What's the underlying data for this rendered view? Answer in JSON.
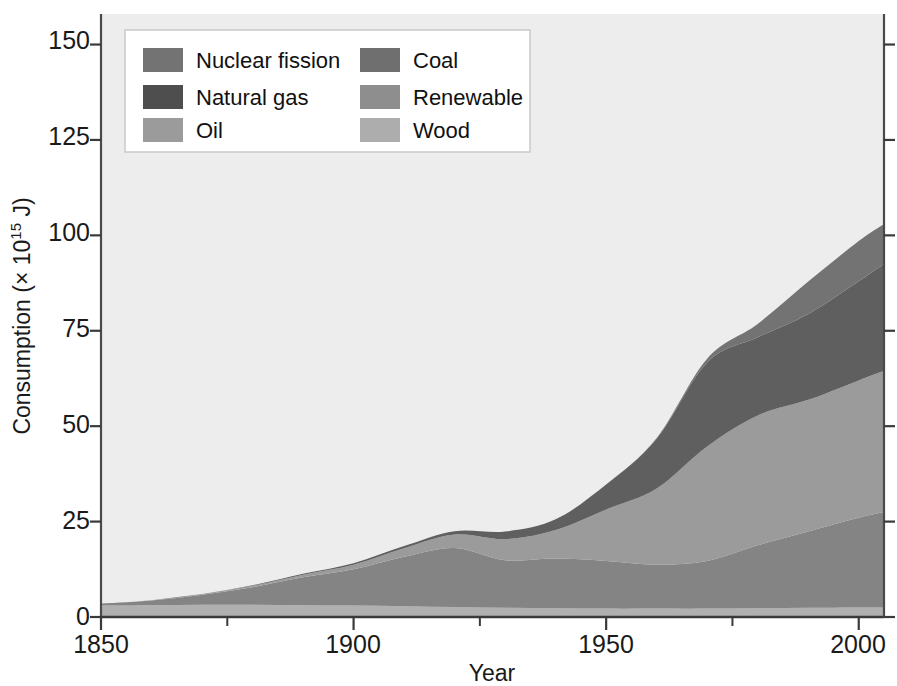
{
  "chart_data": {
    "type": "area",
    "stacked": true,
    "title": "",
    "xlabel": "Year",
    "ylabel": "Consumption (× 10¹⁵ J)",
    "ylabel_parts": {
      "prefix": "Consumption (× 10",
      "exponent": "15",
      "suffix": " J)"
    },
    "xlim": [
      1850,
      2005
    ],
    "ylim": [
      0,
      158
    ],
    "xticks": [
      1850,
      1900,
      1950,
      2000
    ],
    "xtick_labels": [
      "1850",
      "1900",
      "1950",
      "2000"
    ],
    "xminorticks": [
      1875,
      1925,
      1975
    ],
    "yticks": [
      0,
      25,
      50,
      75,
      100,
      125,
      150
    ],
    "ytick_labels": [
      "0",
      "25",
      "50",
      "75",
      "100",
      "125",
      "150"
    ],
    "grid": false,
    "legend_position": "upper-left",
    "plot_background": "#ededed",
    "x": [
      1850,
      1860,
      1870,
      1880,
      1890,
      1900,
      1910,
      1920,
      1930,
      1940,
      1950,
      1960,
      1970,
      1980,
      1990,
      2000,
      2005
    ],
    "stack_order_bottom_to_top": [
      "Wood",
      "Coal",
      "Oil",
      "Natural gas",
      "Nuclear fission"
    ],
    "series": [
      {
        "name": "Wood",
        "color": "#b0b0b0",
        "values": [
          3.0,
          3.1,
          3.2,
          3.2,
          3.1,
          3.0,
          2.8,
          2.6,
          2.4,
          2.3,
          2.2,
          2.2,
          2.2,
          2.3,
          2.4,
          2.5,
          2.5
        ]
      },
      {
        "name": "Coal",
        "color": "#848484",
        "values": [
          0.5,
          1.2,
          2.6,
          4.6,
          7.3,
          9.5,
          13.0,
          15.5,
          12.5,
          13.0,
          12.5,
          11.5,
          12.5,
          16.5,
          20.0,
          23.5,
          25.0
        ]
      },
      {
        "name": "Oil",
        "color": "#9b9b9b",
        "values": [
          0.0,
          0.1,
          0.2,
          0.4,
          0.7,
          1.2,
          2.2,
          3.5,
          5.5,
          7.5,
          13.5,
          20.0,
          30.0,
          34.0,
          34.5,
          36.0,
          37.0
        ]
      },
      {
        "name": "Natural gas",
        "color": "#5f5f5f",
        "values": [
          0.0,
          0.0,
          0.0,
          0.1,
          0.2,
          0.4,
          0.6,
          0.9,
          2.0,
          2.8,
          6.5,
          13.0,
          22.0,
          20.5,
          22.5,
          26.0,
          28.0
        ]
      },
      {
        "name": "Nuclear fission",
        "color": "#737373",
        "values": [
          0.0,
          0.0,
          0.0,
          0.0,
          0.0,
          0.0,
          0.0,
          0.0,
          0.0,
          0.0,
          0.0,
          0.2,
          1.0,
          3.5,
          8.5,
          10.5,
          10.5
        ]
      }
    ],
    "legend_entries": [
      {
        "label": "Nuclear fission",
        "color": "#737373",
        "column": 0,
        "row": 0
      },
      {
        "label": "Natural gas",
        "color": "#4e4e4e",
        "column": 0,
        "row": 1
      },
      {
        "label": "Oil",
        "color": "#9b9b9b",
        "column": 0,
        "row": 2
      },
      {
        "label": "Coal",
        "color": "#6f6f6f",
        "column": 1,
        "row": 0
      },
      {
        "label": "Renewable",
        "color": "#8e8e8e",
        "column": 1,
        "row": 1
      },
      {
        "label": "Wood",
        "color": "#adadad",
        "column": 1,
        "row": 2
      }
    ]
  },
  "axes": {
    "y_title_prefix": "Consumption (× 10",
    "y_title_exponent": "15",
    "y_title_suffix": " J)",
    "x_title": "Year",
    "y_tick_0": "0",
    "y_tick_25": "25",
    "y_tick_50": "50",
    "y_tick_75": "75",
    "y_tick_100": "100",
    "y_tick_125": "125",
    "y_tick_150": "150",
    "x_tick_1850": "1850",
    "x_tick_1900": "1900",
    "x_tick_1950": "1950",
    "x_tick_2000": "2000"
  },
  "legend": {
    "nuclear": "Nuclear fission",
    "gas": "Natural gas",
    "oil": "Oil",
    "coal": "Coal",
    "renewable": "Renewable",
    "wood": "Wood"
  }
}
